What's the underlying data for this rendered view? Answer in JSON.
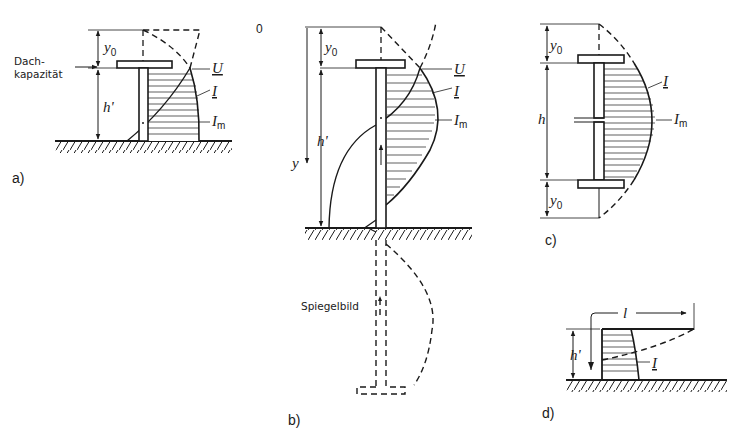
{
  "figure": {
    "panels": [
      {
        "id": "a",
        "label": "a)",
        "annotations": {
          "roof_capacity_line1": "Dach-",
          "roof_capacity_line2": "kapazität",
          "y0": "y",
          "y0_sub": "0",
          "height": "h'",
          "voltage": "U",
          "current": "I",
          "current_max": "I",
          "current_max_sub": "m"
        }
      },
      {
        "id": "b",
        "label": "b)",
        "annotations": {
          "origin": "0",
          "y0": "y",
          "y0_sub": "0",
          "height": "h'",
          "axis_y": "y",
          "voltage": "U",
          "current": "I",
          "current_max": "I",
          "current_max_sub": "m",
          "mirror_image": "Spiegelbild"
        }
      },
      {
        "id": "c",
        "label": "c)",
        "annotations": {
          "y0_top": "y",
          "y0_top_sub": "0",
          "height": "h",
          "y0_bottom": "y",
          "y0_bottom_sub": "0",
          "current": "I",
          "current_max": "I",
          "current_max_sub": "m"
        }
      },
      {
        "id": "d",
        "label": "d)",
        "annotations": {
          "length": "l",
          "height": "h'",
          "current": "I"
        }
      }
    ]
  },
  "colors": {
    "ink": "#1a1a1a",
    "background": "#ffffff"
  }
}
